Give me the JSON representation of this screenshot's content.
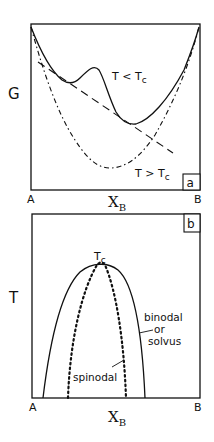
{
  "panel_a": {
    "tag": "a",
    "ylabel": "G",
    "xlabel_main": "X",
    "xlabel_sub": "B",
    "x_left": "A",
    "x_right": "B",
    "curve_low_T_label": "T < T",
    "curve_low_T_sub": "c",
    "curve_high_T_label": "T > T",
    "curve_high_T_sub": "c"
  },
  "panel_b": {
    "tag": "b",
    "ylabel": "T",
    "xlabel_main": "X",
    "xlabel_sub": "B",
    "x_left": "A",
    "x_right": "B",
    "peak_label": "T",
    "peak_sub": "c",
    "binodal_label_1": "binodal",
    "binodal_label_2": "or",
    "binodal_label_3": "solvus",
    "spinodal_label": "spinodal"
  },
  "colors": {
    "ink": "#111111",
    "background": "#ffffff"
  }
}
